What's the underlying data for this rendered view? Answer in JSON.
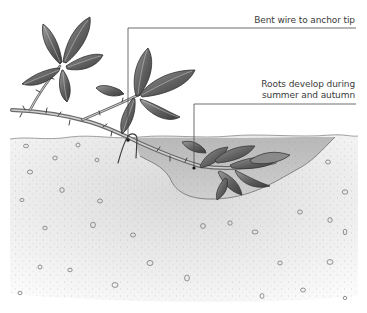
{
  "diagram": {
    "annotations": [
      {
        "id": "wire",
        "lines": [
          "Bent wire to anchor tip"
        ],
        "leader": {
          "label_y": 28,
          "x_from": 128,
          "x_to": 356,
          "drop_x": 128,
          "drop_to_y": 140
        }
      },
      {
        "id": "roots",
        "lines": [
          "Roots develop during",
          "summer and autumn"
        ],
        "leader": {
          "label_y": 104,
          "x_from": 194,
          "x_to": 356,
          "drop_x": 194,
          "drop_to_y": 168
        }
      }
    ],
    "colors": {
      "text": "#3a3a3a",
      "leader": "#4a4a4a",
      "soil": "#e6e6e6",
      "soil_dark": "#bdbdbd",
      "hole": "#a9a9a9",
      "leaf": "#6d6d6d",
      "leaf_dark": "#3c3c3c",
      "stem": "#8a8a8a"
    }
  }
}
